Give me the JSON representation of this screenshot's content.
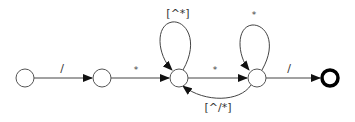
{
  "diagram": {
    "type": "finite-state-automaton",
    "states": [
      {
        "id": "s0",
        "label": "",
        "final": false
      },
      {
        "id": "s1",
        "label": "",
        "final": false
      },
      {
        "id": "s2",
        "label": "",
        "final": false
      },
      {
        "id": "s3",
        "label": "",
        "final": false
      },
      {
        "id": "s4",
        "label": "",
        "final": true
      }
    ],
    "transitions": [
      {
        "from": "s0",
        "to": "s1",
        "label": "/"
      },
      {
        "from": "s1",
        "to": "s2",
        "label": "*"
      },
      {
        "from": "s2",
        "to": "s2",
        "label": "[^*]"
      },
      {
        "from": "s2",
        "to": "s3",
        "label": "*"
      },
      {
        "from": "s3",
        "to": "s3",
        "label": "*"
      },
      {
        "from": "s3",
        "to": "s2",
        "label": "[^/*]"
      },
      {
        "from": "s3",
        "to": "s4",
        "label": "/"
      }
    ]
  },
  "colors": {
    "stroke": "#444444",
    "final_stroke": "#000000",
    "background": "#ffffff"
  }
}
